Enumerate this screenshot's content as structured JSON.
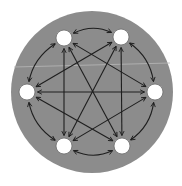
{
  "diagram": {
    "type": "complete-directed-graph",
    "colors": {
      "background": "#ffffff",
      "disc": "#8c8c8c",
      "node_fill": "#ffffff",
      "node_stroke": "#6a6a6a",
      "edge": "#1e1e1e"
    },
    "disc": {
      "cx": 92,
      "cy": 92,
      "r": 81
    },
    "node_radius": 8,
    "nodes": [
      {
        "id": "n1",
        "cx": 64,
        "cy": 38
      },
      {
        "id": "n2",
        "cx": 121,
        "cy": 37
      },
      {
        "id": "n3",
        "cx": 155,
        "cy": 92
      },
      {
        "id": "n4",
        "cx": 122,
        "cy": 146
      },
      {
        "id": "n5",
        "cx": 64,
        "cy": 146
      },
      {
        "id": "n6",
        "cx": 27,
        "cy": 92
      }
    ],
    "edges": [
      {
        "from": "n1",
        "to": "n2",
        "style": "arc",
        "bidirectional": true
      },
      {
        "from": "n2",
        "to": "n3",
        "style": "arc",
        "bidirectional": true
      },
      {
        "from": "n3",
        "to": "n4",
        "style": "arc",
        "bidirectional": true
      },
      {
        "from": "n4",
        "to": "n5",
        "style": "arc",
        "bidirectional": true
      },
      {
        "from": "n5",
        "to": "n6",
        "style": "arc",
        "bidirectional": true
      },
      {
        "from": "n6",
        "to": "n1",
        "style": "arc",
        "bidirectional": true
      },
      {
        "from": "n1",
        "to": "n3",
        "style": "line",
        "bidirectional": true
      },
      {
        "from": "n1",
        "to": "n4",
        "style": "line",
        "bidirectional": true
      },
      {
        "from": "n1",
        "to": "n5",
        "style": "line",
        "bidirectional": true
      },
      {
        "from": "n2",
        "to": "n4",
        "style": "line",
        "bidirectional": true
      },
      {
        "from": "n2",
        "to": "n5",
        "style": "line",
        "bidirectional": true
      },
      {
        "from": "n2",
        "to": "n6",
        "style": "line",
        "bidirectional": true
      },
      {
        "from": "n3",
        "to": "n5",
        "style": "line",
        "bidirectional": true
      },
      {
        "from": "n3",
        "to": "n6",
        "style": "line",
        "bidirectional": true
      },
      {
        "from": "n4",
        "to": "n6",
        "style": "line",
        "bidirectional": true
      }
    ]
  }
}
